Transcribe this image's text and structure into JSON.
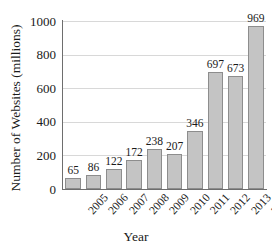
{
  "chart_data": {
    "type": "bar",
    "title": "",
    "xlabel": "Year",
    "ylabel": "Number of Websites (millions)",
    "categories": [
      "2005",
      "2006",
      "2007",
      "2008",
      "2009",
      "2010",
      "2011",
      "2012",
      "2013",
      "2014"
    ],
    "values": [
      65,
      86,
      122,
      172,
      238,
      207,
      346,
      697,
      673,
      969
    ],
    "value_labels": [
      "65",
      "86",
      "122",
      "172",
      "238",
      "207",
      "346",
      "697",
      "673",
      "969"
    ],
    "ylim": [
      0,
      1000
    ],
    "yticks": [
      0,
      200,
      400,
      600,
      800,
      1000
    ],
    "ytick_labels": [
      "0",
      "200",
      "400",
      "600",
      "800",
      "1000"
    ],
    "grid": true,
    "legend": "none",
    "series_color": "#c4c4c4",
    "series_border_color": "#8d8d8d",
    "grid_color": "#d8d8d8",
    "axis_color": "#6e6e6e",
    "text_color": "#1a1a1a"
  }
}
